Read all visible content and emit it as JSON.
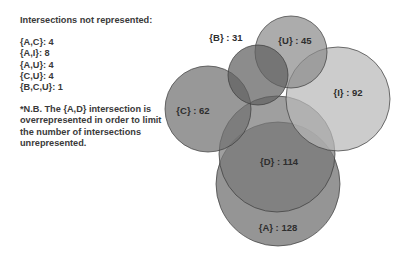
{
  "legend": {
    "title": "Intersections not represented:",
    "items": [
      {
        "label": "{A,C}: 4"
      },
      {
        "label": "{A,I}: 8"
      },
      {
        "label": "{A,U}: 4"
      },
      {
        "label": "{C,U}: 4"
      },
      {
        "label": "{B,C,U}: 1"
      }
    ],
    "note": "*N.B. The {A,D} intersection is overrepresented in order to limit the number of intersections unrepresented."
  },
  "sets": [
    {
      "id": "A",
      "label": "{A} : 128",
      "size": 128,
      "color": "#6c6c6c"
    },
    {
      "id": "D",
      "label": "{D} : 114",
      "size": 114,
      "color": "#7a7a7a"
    },
    {
      "id": "I",
      "label": "{I} : 92",
      "size": 92,
      "color": "#b8b8b8"
    },
    {
      "id": "C",
      "label": "{C} : 62",
      "size": 62,
      "color": "#707070"
    },
    {
      "id": "U",
      "label": "{U} : 45",
      "size": 45,
      "color": "#8c8c8c"
    },
    {
      "id": "B",
      "label": "{B} : 31",
      "size": 31,
      "color": "#606060"
    }
  ],
  "chart_data": {
    "type": "venn",
    "sets": [
      {
        "name": "A",
        "size": 128
      },
      {
        "name": "D",
        "size": 114
      },
      {
        "name": "I",
        "size": 92
      },
      {
        "name": "C",
        "size": 62
      },
      {
        "name": "U",
        "size": 45
      },
      {
        "name": "B",
        "size": 31
      }
    ],
    "unrepresented_intersections": [
      {
        "sets": [
          "A",
          "C"
        ],
        "size": 4
      },
      {
        "sets": [
          "A",
          "I"
        ],
        "size": 8
      },
      {
        "sets": [
          "A",
          "U"
        ],
        "size": 4
      },
      {
        "sets": [
          "C",
          "U"
        ],
        "size": 4
      },
      {
        "sets": [
          "B",
          "C",
          "U"
        ],
        "size": 1
      }
    ],
    "annotation": "*N.B. The {A,D} intersection is overrepresented in order to limit the number of intersections unrepresented."
  }
}
